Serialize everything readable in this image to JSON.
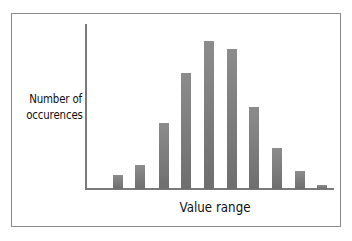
{
  "chart_data": {
    "type": "bar",
    "title": "",
    "xlabel": "Value range",
    "ylabel": "Number of occurences",
    "ylabel_lines": [
      "Number of",
      "occurences"
    ],
    "categories": [
      "1",
      "2",
      "3",
      "4",
      "5",
      "6",
      "7",
      "8",
      "9",
      "10"
    ],
    "values": [
      14,
      24,
      66,
      116,
      148,
      140,
      82,
      41,
      18,
      4
    ],
    "ylim": [
      0,
      165
    ],
    "grid": false,
    "legend": null,
    "bar_color": "#7d7d7d"
  },
  "layout": {
    "baseline_y": 189,
    "bar_x": [
      113,
      135,
      159,
      181,
      204,
      227,
      249,
      272,
      295,
      317
    ]
  }
}
